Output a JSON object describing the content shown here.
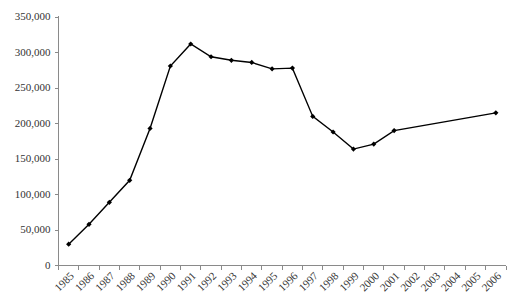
{
  "chart_data": {
    "type": "line",
    "title": "",
    "subtitle": "",
    "xlabel": "",
    "ylabel": "",
    "categories": [
      "1985",
      "1986",
      "1987",
      "1988",
      "1989",
      "1990",
      "1991",
      "1992",
      "1993",
      "1994",
      "1995",
      "1996",
      "1997",
      "1998",
      "1999",
      "2000",
      "2001",
      "2002",
      "2003",
      "2004",
      "2005",
      "2006"
    ],
    "values": [
      30000,
      58000,
      89000,
      120000,
      193000,
      281000,
      312000,
      294000,
      289000,
      286000,
      277000,
      278000,
      210000,
      188000,
      164000,
      171000,
      190000,
      null,
      null,
      null,
      null,
      215000
    ],
    "series": [
      {
        "name": "series-1",
        "values": [
          30000,
          58000,
          89000,
          120000,
          193000,
          281000,
          312000,
          294000,
          289000,
          286000,
          277000,
          278000,
          210000,
          188000,
          164000,
          171000,
          190000,
          null,
          null,
          null,
          null,
          215000
        ]
      }
    ],
    "ylim": [
      0,
      350000
    ],
    "ytick_values": [
      0,
      50000,
      100000,
      150000,
      200000,
      250000,
      300000,
      350000
    ],
    "ytick_labels": [
      "0",
      "50,000",
      "100,000",
      "150,000",
      "200,000",
      "250,000",
      "300,000",
      "350,000"
    ],
    "xtick_labels": [
      "1985",
      "1986",
      "1987",
      "1988",
      "1989",
      "1990",
      "1991",
      "1992",
      "1993",
      "1994",
      "1995",
      "1996",
      "1997",
      "1998",
      "1999",
      "2000",
      "2001",
      "2002",
      "2003",
      "2004",
      "2005",
      "2006"
    ],
    "xtick_label_rotation": -45,
    "grid": false,
    "legend": false,
    "legend_position": "none",
    "marker": "diamond",
    "line_color": "#000000",
    "marker_color": "#000000",
    "axis_color": "#8a8a8a",
    "text_color": "#333333",
    "background_color": "#ffffff",
    "annotations": []
  }
}
